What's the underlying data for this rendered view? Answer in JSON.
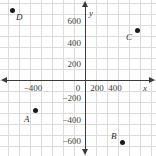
{
  "chart_data": {
    "type": "scatter",
    "title": "",
    "xlabel": "x",
    "ylabel": "y",
    "xlim": [
      -700,
      700
    ],
    "ylim": [
      -700,
      700
    ],
    "grid": true,
    "legend": "none",
    "x_ticks": [
      "-400",
      "0",
      "200",
      "400"
    ],
    "y_ticks": [
      "600",
      "400",
      "200",
      "-200",
      "-400",
      "-600"
    ],
    "points": [
      {
        "label": "D",
        "x": -650,
        "y": 650
      },
      {
        "label": "C",
        "x": 500,
        "y": 500
      },
      {
        "label": "A",
        "x": -500,
        "y": -300
      },
      {
        "label": "B",
        "x": 350,
        "y": -650
      }
    ]
  },
  "axes": {
    "x_name": "x",
    "y_name": "y",
    "x_tick_labels": [
      {
        "text": "-400",
        "left": 18,
        "top": 83
      },
      {
        "text": "0",
        "left": 63,
        "top": 83
      },
      {
        "text": "200",
        "left": 82,
        "top": 83
      },
      {
        "text": "400",
        "left": 100,
        "top": 83
      }
    ],
    "y_tick_labels": [
      {
        "text": "600",
        "left": 47,
        "top": 16
      },
      {
        "text": "400",
        "left": 47,
        "top": 38
      },
      {
        "text": "200",
        "left": 47,
        "top": 59
      },
      {
        "text": "-200",
        "left": 47,
        "top": 93
      },
      {
        "text": "-400",
        "left": 47,
        "top": 115
      },
      {
        "text": "-600",
        "left": 47,
        "top": 136
      }
    ]
  },
  "points": [
    {
      "name": "point-d",
      "label": "D",
      "dot_left": 10,
      "dot_top": 8,
      "label_left": 16,
      "label_top": 13
    },
    {
      "name": "point-c",
      "label": "C",
      "dot_left": 135,
      "dot_top": 28,
      "label_left": 126,
      "label_top": 33
    },
    {
      "name": "point-a",
      "label": "A",
      "dot_left": 33,
      "dot_top": 108,
      "label_left": 24,
      "label_top": 115
    },
    {
      "name": "point-b",
      "label": "B",
      "dot_left": 120,
      "dot_top": 140,
      "label_left": 111,
      "label_top": 132
    }
  ],
  "grid_geometry": {
    "spacing": 11,
    "v_positions": [
      8,
      19,
      30,
      41,
      52,
      63,
      74,
      85,
      96,
      107,
      118,
      129,
      140,
      151
    ],
    "h_positions": [
      3,
      14,
      25,
      36,
      47,
      58,
      69,
      80,
      91,
      102,
      113,
      124,
      135,
      146
    ]
  },
  "colors": {
    "grid": "#dcdcdc",
    "axis": "#3a3a3a",
    "point": "#1a1a1a",
    "text": "#444444",
    "background": "#ffffff"
  }
}
